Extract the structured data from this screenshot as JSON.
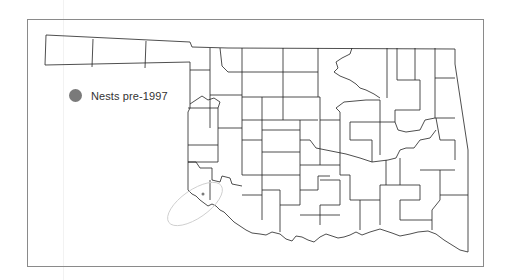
{
  "map": {
    "region": "Oklahoma",
    "subdivision": "counties",
    "border_color": "#8a8a8a",
    "line_color": "#222222",
    "annotation_color": "#c8c8c8"
  },
  "legend": {
    "items": [
      {
        "label": "Nests pre-1997",
        "symbol": "circle",
        "color": "#7a7a7a"
      }
    ]
  },
  "annotation": {
    "type": "hand-drawn ellipse",
    "location": "southwest Oklahoma (Red River border)"
  }
}
